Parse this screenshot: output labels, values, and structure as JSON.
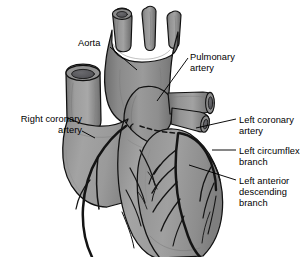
{
  "figure": {
    "background_color": "#ffffff",
    "outline_color": "#000000",
    "palette": {
      "vessel_dark": "#848484",
      "myocardium_mid": "#9a9a9a",
      "highlight_light": "#b4b4b4",
      "shadow_dark": "#6d6d6d",
      "lumen_dark": "#55555a",
      "leader_line": "#000000",
      "artery_line": "#1a1a1a"
    }
  },
  "labels": [
    {
      "id": "aorta",
      "text": "Aorta",
      "align": "left",
      "x": 78,
      "y": 38,
      "leader": {
        "x1": 110,
        "y1": 47,
        "x2": 137,
        "y2": 70
      }
    },
    {
      "id": "pulmonary-artery",
      "text": "Pulmonary\nartery",
      "align": "left",
      "x": 190,
      "y": 52,
      "leader": {
        "x1": 188,
        "y1": 58,
        "x2": 157,
        "y2": 101
      }
    },
    {
      "id": "right-coronary-artery",
      "text": "Right coronary\nartery",
      "align": "right",
      "x": 9,
      "y": 114,
      "leader": {
        "x1": 82,
        "y1": 131,
        "x2": 95,
        "y2": 138
      }
    },
    {
      "id": "left-coronary-artery",
      "text": "Left coronary\nartery",
      "align": "left",
      "x": 239,
      "y": 115,
      "leader": {
        "x1": 236,
        "y1": 119,
        "x2": 196,
        "y2": 128
      }
    },
    {
      "id": "left-circumflex-branch",
      "text": "Left circumflex\nbranch",
      "align": "left",
      "x": 239,
      "y": 146,
      "leader": {
        "x1": 236,
        "y1": 150,
        "x2": 212,
        "y2": 150
      }
    },
    {
      "id": "left-anterior-descending-branch",
      "text": "Left anterior\ndescending\nbranch",
      "align": "left",
      "x": 239,
      "y": 176,
      "leader": {
        "x1": 236,
        "y1": 180,
        "x2": 189,
        "y2": 165
      }
    }
  ],
  "anatomy": {
    "structures": [
      "aortic arch",
      "brachiocephalic trunk",
      "left common carotid artery",
      "left subclavian artery",
      "superior vena cava",
      "ascending aorta",
      "pulmonary trunk",
      "right pulmonary artery",
      "left pulmonary artery",
      "right atrium",
      "right ventricle",
      "left ventricle",
      "right coronary artery",
      "left coronary artery",
      "left circumflex branch",
      "left anterior descending branch"
    ]
  }
}
